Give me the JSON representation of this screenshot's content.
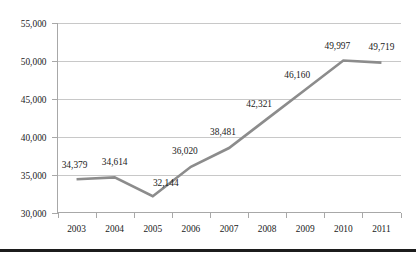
{
  "chart_data": {
    "type": "line",
    "title": "",
    "subtitle": "",
    "xlabel": "",
    "ylabel": "",
    "categories": [
      "2003",
      "2004",
      "2005",
      "2006",
      "2007",
      "2008",
      "2009",
      "2010",
      "2011"
    ],
    "values": [
      34379,
      34614,
      32144,
      36020,
      38481,
      42321,
      46160,
      49997,
      49719
    ],
    "point_labels": [
      "34,379",
      "34,614",
      "32,144",
      "36,020",
      "38,481",
      "42,321",
      "46,160",
      "49,997",
      "49,719"
    ],
    "ylim": [
      30000,
      55000
    ],
    "ytick_values": [
      30000,
      35000,
      40000,
      45000,
      50000,
      55000
    ],
    "ytick_labels": [
      "30,000",
      "35,000",
      "40,000",
      "45,000",
      "50,000",
      "55,000"
    ],
    "grid": true,
    "legend": false,
    "legend_position": "none",
    "series": [
      {
        "name": "",
        "values": [
          34379,
          34614,
          32144,
          36020,
          38481,
          42321,
          46160,
          49997,
          49719
        ],
        "color": "#8c8c8c"
      }
    ],
    "colors": {
      "line": "#8c8c8c",
      "gridline": "#c8c8c8",
      "axis": "#a8a8a8",
      "text": "#1a1a1a",
      "background": "#ffffff",
      "bottom_rule": "#1c1c1c"
    }
  }
}
